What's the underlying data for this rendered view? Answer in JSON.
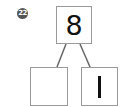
{
  "problem": {
    "number": "22"
  },
  "number_bond": {
    "whole": "8",
    "parts": [
      "",
      "1"
    ]
  },
  "colors": {
    "line": "#666666",
    "box_border": "#9a9a9a",
    "badge": "#555555"
  }
}
